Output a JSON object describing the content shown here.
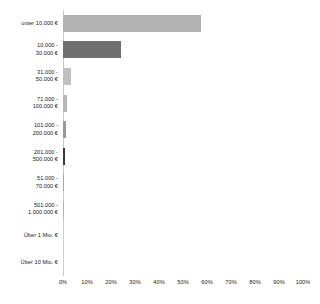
{
  "chart_data": {
    "type": "bar",
    "orientation": "horizontal",
    "title": "",
    "subtitle": "",
    "xlabel": "",
    "ylabel": "",
    "xlim": [
      0,
      100
    ],
    "grid": false,
    "legend": false,
    "value_suffix": "%",
    "categories": [
      "unter 10.000 €",
      "10.000 - 30.000 €",
      "31.000 - 50.000 €",
      "71.000 - 100.000 €",
      "101.000 - 200.000 €",
      "201.000 - 500.000 €",
      "51.000 - 70.000 €",
      "501.000 - 1.000.000 €",
      "Über 1 Mio. €",
      "Über 10 Mio. €"
    ],
    "category_lines": [
      [
        "unter 10.000 €"
      ],
      [
        "10.000 -",
        "30.000 €"
      ],
      [
        "31.000 -",
        "50.000 €"
      ],
      [
        "71.000 -",
        "100.000 €"
      ],
      [
        "101.000 -",
        "200.000 €"
      ],
      [
        "201.000 -",
        "500.000 €"
      ],
      [
        "51.000 -",
        "70.000 €"
      ],
      [
        "501.000 -",
        "1.000.000 €"
      ],
      [
        "Über 1 Mio. €"
      ],
      [
        "Über 10 Mio. €"
      ]
    ],
    "values": [
      57.5,
      24,
      3.5,
      1.7,
      1.3,
      1.0,
      0.5,
      0.5,
      0.2,
      0.2
    ],
    "bar_colors": [
      "#b3b3b3",
      "#6f6f6f",
      "#c0c0c0",
      "#b8b8b8",
      "#9a9a9a",
      "#3a3a3a",
      "#a8a8a8",
      "#b5b5b5",
      "#cfcfcf",
      "#cfcfcf"
    ],
    "xticks": [
      0,
      10,
      20,
      30,
      40,
      50,
      60,
      70,
      80,
      90,
      100
    ],
    "xtick_labels": [
      "0%",
      "10%",
      "20%",
      "30%",
      "40%",
      "50%",
      "60%",
      "70%",
      "80%",
      "90%",
      "100%"
    ],
    "axis_color": "#c9c9c9",
    "background_color": "#ffffff",
    "text_color": "#1a1a1a"
  }
}
